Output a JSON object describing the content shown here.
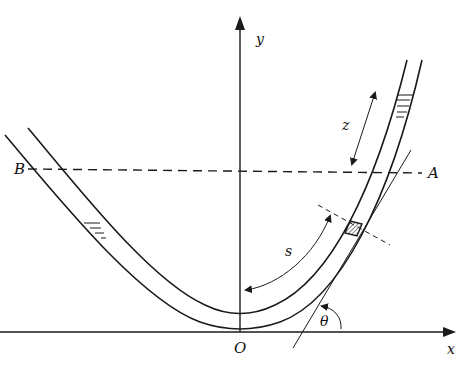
{
  "figure": {
    "type": "U-tube manometer / curved tube diagram",
    "labels": {
      "y_axis": "y",
      "x_axis": "x",
      "origin": "O",
      "point_A": "A",
      "point_B": "B",
      "arc_length": "s",
      "height": "z",
      "angle": "θ"
    },
    "colors": {
      "stroke": "#1a1a1a",
      "background": "#ffffff"
    }
  }
}
